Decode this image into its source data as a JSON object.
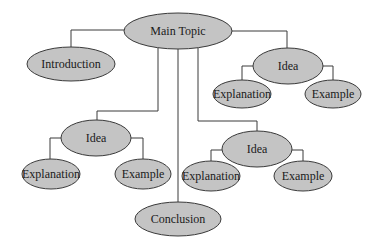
{
  "diagram": {
    "type": "concept-map",
    "colors": {
      "node_fill": "#c4c4c4",
      "node_stroke": "#3a3a3a",
      "edge": "#3a3a3a",
      "background": "#ffffff"
    },
    "nodes": {
      "main": {
        "label": "Main Topic"
      },
      "intro": {
        "label": "Introduction"
      },
      "idea1": {
        "label": "Idea"
      },
      "idea1_expl": {
        "label": "Explanation"
      },
      "idea1_ex": {
        "label": "Example"
      },
      "idea2": {
        "label": "Idea"
      },
      "idea2_expl": {
        "label": "Explanation"
      },
      "idea2_ex": {
        "label": "Example"
      },
      "idea3": {
        "label": "Idea"
      },
      "idea3_expl": {
        "label": "Explanation"
      },
      "idea3_ex": {
        "label": "Example"
      },
      "conclusion": {
        "label": "Conclusion"
      }
    },
    "edges": [
      [
        "main",
        "intro"
      ],
      [
        "main",
        "idea1"
      ],
      [
        "idea1",
        "idea1_expl"
      ],
      [
        "idea1",
        "idea1_ex"
      ],
      [
        "main",
        "idea2"
      ],
      [
        "idea2",
        "idea2_expl"
      ],
      [
        "idea2",
        "idea2_ex"
      ],
      [
        "main",
        "idea3"
      ],
      [
        "idea3",
        "idea3_expl"
      ],
      [
        "idea3",
        "idea3_ex"
      ],
      [
        "main",
        "conclusion"
      ]
    ]
  }
}
